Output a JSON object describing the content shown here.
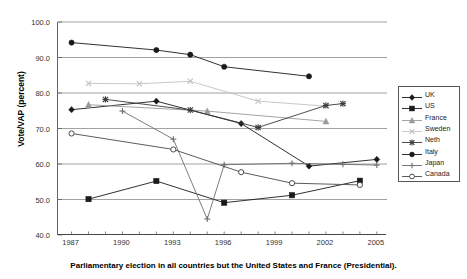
{
  "chart_data": {
    "type": "line",
    "title": "",
    "xlabel": "",
    "ylabel": "Vote/VAP (percent)",
    "xlim": [
      1986.2,
      2005.6
    ],
    "ylim": [
      40.0,
      100.0
    ],
    "grid": true,
    "grid_axis": "y",
    "legend_position": "right",
    "x_ticks": [
      1987,
      1990,
      1993,
      1996,
      1999,
      2002,
      2005
    ],
    "x_tick_labels": [
      "1987",
      "1990",
      "1993",
      "1996",
      "1999",
      "2002",
      "2005"
    ],
    "x_minor_tick_step": 1,
    "y_ticks": [
      40.0,
      50.0,
      60.0,
      70.0,
      80.0,
      90.0,
      100.0
    ],
    "y_tick_labels": [
      "40.0",
      "50.0",
      "60.0",
      "70.0",
      "80.0",
      "90.0",
      "100.0"
    ],
    "series": [
      {
        "name": "UK",
        "marker": "diamond",
        "color": "#1a1a1a",
        "points": [
          {
            "x": 1987,
            "y": 75.3
          },
          {
            "x": 1992,
            "y": 77.7
          },
          {
            "x": 1997,
            "y": 71.4
          },
          {
            "x": 2001,
            "y": 59.4
          },
          {
            "x": 2005,
            "y": 61.3
          }
        ]
      },
      {
        "name": "US",
        "marker": "square",
        "color": "#1a1a1a",
        "points": [
          {
            "x": 1988,
            "y": 50.1
          },
          {
            "x": 1992,
            "y": 55.2
          },
          {
            "x": 1996,
            "y": 49.1
          },
          {
            "x": 2000,
            "y": 51.2
          },
          {
            "x": 2004,
            "y": 55.3
          }
        ]
      },
      {
        "name": "France",
        "marker": "triangle",
        "color": "#9a9a9a",
        "points": [
          {
            "x": 1988,
            "y": 76.7
          },
          {
            "x": 1995,
            "y": 74.9
          },
          {
            "x": 2002,
            "y": 72.0
          }
        ]
      },
      {
        "name": "Sweden",
        "marker": "x",
        "color": "#c2c2c2",
        "points": [
          {
            "x": 1988,
            "y": 82.7
          },
          {
            "x": 1991,
            "y": 82.6
          },
          {
            "x": 1994,
            "y": 83.3
          },
          {
            "x": 1998,
            "y": 77.7
          },
          {
            "x": 2002,
            "y": 76.3
          }
        ]
      },
      {
        "name": "Neth",
        "marker": "star",
        "color": "#3a3a3a",
        "points": [
          {
            "x": 1989,
            "y": 78.2
          },
          {
            "x": 1994,
            "y": 75.2
          },
          {
            "x": 1998,
            "y": 70.3
          },
          {
            "x": 2002,
            "y": 76.5
          },
          {
            "x": 2003,
            "y": 77.0
          }
        ]
      },
      {
        "name": "Italy",
        "marker": "circle-filled",
        "color": "#1a1a1a",
        "points": [
          {
            "x": 1987,
            "y": 94.2
          },
          {
            "x": 1992,
            "y": 92.1
          },
          {
            "x": 1994,
            "y": 90.8
          },
          {
            "x": 1996,
            "y": 87.4
          },
          {
            "x": 2001,
            "y": 84.7
          }
        ]
      },
      {
        "name": "Japan",
        "marker": "plus",
        "color": "#6e6e6e",
        "points": [
          {
            "x": 1990,
            "y": 74.9
          },
          {
            "x": 1993,
            "y": 67.0
          },
          {
            "x": 1995,
            "y": 44.5
          },
          {
            "x": 1996,
            "y": 59.8
          },
          {
            "x": 2000,
            "y": 60.2
          },
          {
            "x": 2003,
            "y": 59.9
          },
          {
            "x": 2005,
            "y": 59.7
          }
        ]
      },
      {
        "name": "Canada",
        "marker": "circle-open",
        "color": "#4a4a4a",
        "points": [
          {
            "x": 1987,
            "y": 68.6
          },
          {
            "x": 1993,
            "y": 64.1
          },
          {
            "x": 1997,
            "y": 57.7
          },
          {
            "x": 2000,
            "y": 54.6
          },
          {
            "x": 2004,
            "y": 54.1
          }
        ]
      }
    ]
  },
  "axis": {
    "y_title": "Vote/VAP (percent)"
  },
  "legend": {
    "entries": [
      {
        "label": "UK"
      },
      {
        "label": "US"
      },
      {
        "label": "France"
      },
      {
        "label": "Sweden"
      },
      {
        "label": "Neth"
      },
      {
        "label": "Italy"
      },
      {
        "label": "Japan"
      },
      {
        "label": "Canada"
      }
    ]
  },
  "caption": {
    "text": "Parliamentary election in all countries but the United States and France (Presidential)."
  }
}
